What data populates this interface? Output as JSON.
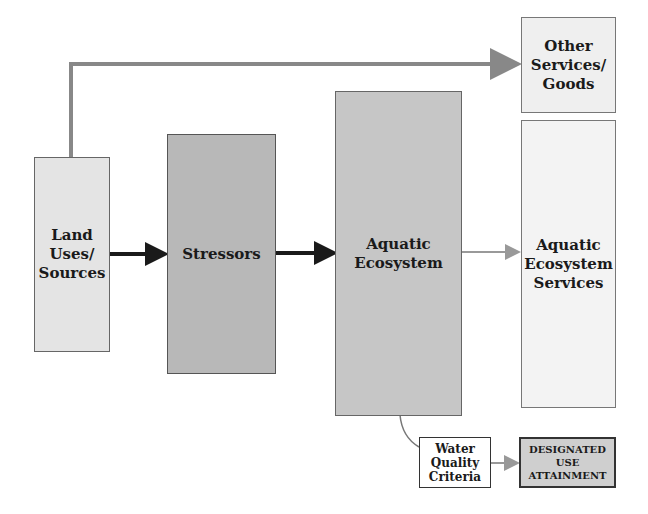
{
  "diagram": {
    "nodes": [
      {
        "id": "land",
        "label": "Land Uses/ Sources",
        "lines": [
          "Land",
          "Uses/",
          "Sources"
        ],
        "fill": "#e4e4e4"
      },
      {
        "id": "stressors",
        "label": "Stressors",
        "lines": [
          "Stressors"
        ],
        "fill": "#b8b8b8"
      },
      {
        "id": "aquatic",
        "label": "Aquatic Ecosystem",
        "lines": [
          "Aquatic",
          "Ecosystem"
        ],
        "fill": "#c6c6c6"
      },
      {
        "id": "other",
        "label": "Other Services/ Goods",
        "lines": [
          "Other",
          "Services/",
          "Goods"
        ],
        "fill": "#efefef"
      },
      {
        "id": "services",
        "label": "Aquatic Ecosystem Services",
        "lines": [
          "Aquatic",
          "Ecosystem",
          "Services"
        ],
        "fill": "#f3f3f3"
      },
      {
        "id": "wqc",
        "label": "Water Quality Criteria",
        "lines": [
          "Water",
          "Quality",
          "Criteria"
        ],
        "fill": "#ffffff"
      },
      {
        "id": "dua",
        "label": "DESIGNATED USE ATTAINMENT",
        "lines": [
          "DESIGNATED",
          "USE",
          "ATTAINMENT"
        ],
        "fill": "#cfcfcf"
      }
    ],
    "edges": [
      {
        "from": "land",
        "to": "other",
        "color": "#888888"
      },
      {
        "from": "land",
        "to": "stressors",
        "color": "#1a1a1a"
      },
      {
        "from": "stressors",
        "to": "aquatic",
        "color": "#1a1a1a"
      },
      {
        "from": "aquatic",
        "to": "services",
        "color": "#999999"
      },
      {
        "from": "aquatic",
        "to": "wqc",
        "color": "#777777"
      },
      {
        "from": "wqc",
        "to": "dua",
        "color": "#777777"
      }
    ]
  }
}
